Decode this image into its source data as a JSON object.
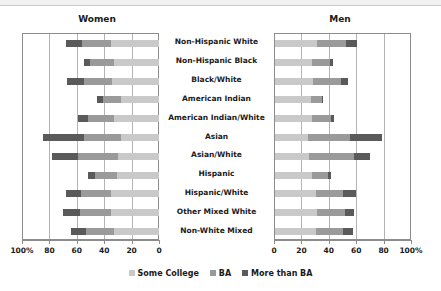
{
  "panels": {
    "women_title": "Women",
    "men_title": "Men"
  },
  "legend": {
    "items": [
      {
        "label": "Some College",
        "color": "#c9c9c9",
        "key": "some_college"
      },
      {
        "label": "BA",
        "color": "#9a9a9a",
        "key": "ba"
      },
      {
        "label": "More than BA",
        "color": "#5a5a5a",
        "key": "more_than_ba"
      }
    ]
  },
  "axis": {
    "women_ticklabels": [
      "100%",
      "80",
      "60",
      "40",
      "20",
      "0"
    ],
    "men_ticklabels": [
      "0",
      "20",
      "40",
      "60",
      "80",
      "100%"
    ],
    "tickvalues": [
      100,
      80,
      60,
      40,
      20,
      0
    ],
    "max": 100
  },
  "chart_data": {
    "type": "bar",
    "orientation": "horizontal",
    "layout": "diverging-paired-stacked",
    "title": "",
    "subtitle": "",
    "xlabel": "",
    "ylabel": "",
    "xlim": [
      0,
      100
    ],
    "grid": true,
    "gridlines_at": [
      0,
      20,
      40,
      60,
      80,
      100
    ],
    "legend_position": "bottom-center",
    "panels": [
      "Women",
      "Men"
    ],
    "categories": [
      "Non-Hispanic White",
      "Non-Hispanic Black",
      "Black/White",
      "American Indian",
      "American Indian/White",
      "Asian",
      "Asian/White",
      "Hispanic",
      "Hispanic/White",
      "Other Mixed White",
      "Non-White Mixed"
    ],
    "series": [
      {
        "panel": "Women",
        "direction": "right-to-left",
        "stacks": [
          {
            "name": "Some College",
            "values": [
              35,
              33,
              34,
              28,
              33,
              28,
              30,
              31,
              35,
              35,
              33
            ]
          },
          {
            "name": "BA",
            "values": [
              21,
              17,
              21,
              13,
              19,
              27,
              29,
              16,
              22,
              23,
              20
            ]
          },
          {
            "name": "More than BA",
            "values": [
              12,
              5,
              12,
              4,
              7,
              30,
              19,
              5,
              11,
              12,
              11
            ]
          }
        ],
        "totals": [
          68,
          55,
          67,
          45,
          59,
          85,
          78,
          52,
          68,
          70,
          64
        ]
      },
      {
        "panel": "Men",
        "direction": "left-to-right",
        "stacks": [
          {
            "name": "Some College",
            "values": [
              31,
              27,
              28,
              26,
              27,
              24,
              25,
              27,
              30,
              31,
              30
            ]
          },
          {
            "name": "BA",
            "values": [
              21,
              13,
              20,
              8,
              14,
              31,
              33,
              12,
              20,
              20,
              20
            ]
          },
          {
            "name": "More than BA",
            "values": [
              8,
              2,
              5,
              1,
              2,
              23,
              11,
              2,
              9,
              7,
              7
            ]
          }
        ],
        "totals": [
          60,
          42,
          53,
          35,
          43,
          78,
          69,
          41,
          59,
          58,
          57
        ]
      }
    ]
  }
}
